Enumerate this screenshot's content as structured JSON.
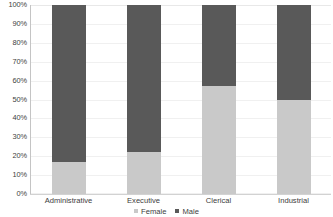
{
  "chart_data": {
    "type": "bar",
    "subtype": "100% stacked column",
    "title": "",
    "subtitle": "",
    "xlabel": "",
    "ylabel": "",
    "categories": [
      "Administrative",
      "Executive",
      "Clerical",
      "Industrial"
    ],
    "series": [
      {
        "name": "Female",
        "color": "#c9c9c9",
        "values": [
          17,
          22,
          57,
          50
        ]
      },
      {
        "name": "Male",
        "color": "#595959",
        "values": [
          83,
          78,
          43,
          50
        ]
      }
    ],
    "ylim": [
      0,
      100
    ],
    "ytick_labels": [
      "100%",
      "90%",
      "80%",
      "70%",
      "60%",
      "50%",
      "40%",
      "30%",
      "20%",
      "10%",
      "0%"
    ],
    "ytick_values": [
      100,
      90,
      80,
      70,
      60,
      50,
      40,
      30,
      20,
      10,
      0
    ],
    "grid": true,
    "grid_axis": "y",
    "legend_position": "bottom",
    "legend_entries": [
      "Female",
      "Male"
    ],
    "annotations": [],
    "background_color": "#ffffff",
    "gridline_color": "#f0f0f0",
    "axis_color": "#c4c4c4"
  }
}
